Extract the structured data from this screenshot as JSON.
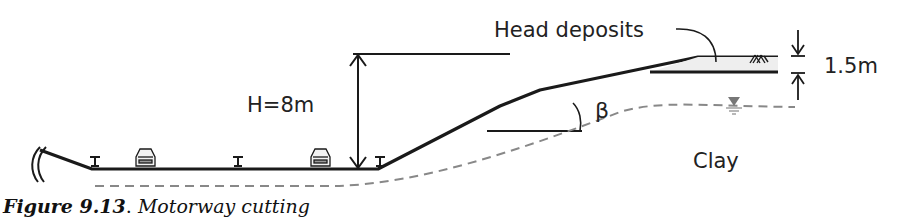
{
  "figure": {
    "caption_label": "Figure 9.13",
    "caption_sep": ". ",
    "caption_title": "Motorway cutting"
  },
  "labels": {
    "height": "H=8m",
    "head_deposits": "Head deposits",
    "thickness": "1.5m",
    "angle": "β",
    "soil": "Clay"
  },
  "symbols": {
    "water_table": "water-table-marker",
    "vehicles": [
      "car",
      "car"
    ],
    "barriers": [
      "crash-barrier",
      "crash-barrier",
      "crash-barrier"
    ]
  },
  "colors": {
    "line": "#1a1a1a",
    "dashed": "#888888",
    "head_fill": "#eeeeee",
    "water_marker": "#777777"
  }
}
